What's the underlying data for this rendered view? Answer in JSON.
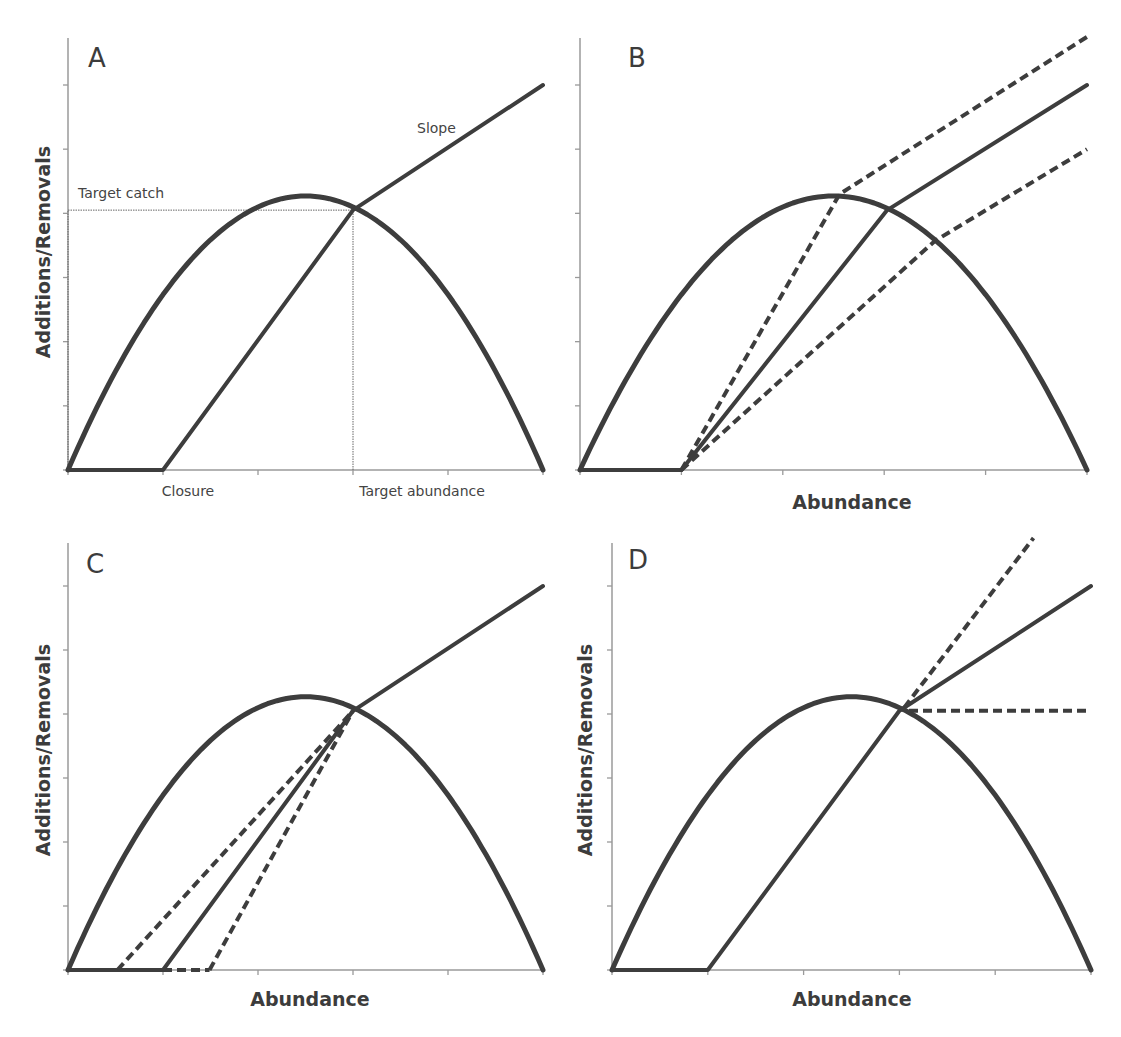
{
  "chart_data": [
    {
      "panel": "A",
      "type": "line",
      "title": "A",
      "xlabel": "",
      "ylabel": "Additions/Removals",
      "xlim": [
        0,
        5
      ],
      "ylim": [
        0,
        6.75
      ],
      "x_ticks": [
        0,
        1,
        2,
        3,
        4,
        5
      ],
      "x_tick_labels": {
        "1": "Closure",
        "3": "Target abundance"
      },
      "y_ticks": [
        0,
        1,
        2,
        3,
        4,
        5,
        6
      ],
      "grid": false,
      "annotations": [
        {
          "text": "Target catch",
          "x": 0.1,
          "y": 4.3
        },
        {
          "text": "Slope",
          "x": 3.65,
          "y": 5.1
        }
      ],
      "reference_lines": [
        {
          "name": "target-catch-line",
          "style": "dotted",
          "points": [
            [
              0,
              4.05
            ],
            [
              3,
              4.05
            ]
          ]
        },
        {
          "name": "target-abundance-line",
          "style": "dotted",
          "points": [
            [
              3,
              0
            ],
            [
              3,
              4.05
            ]
          ]
        },
        {
          "name": "y-axis-dotted",
          "style": "dotted",
          "points": [
            [
              0,
              0
            ],
            [
              0,
              4.05
            ]
          ]
        }
      ],
      "series": [
        {
          "name": "Production (additions)",
          "style": "solid-thick",
          "kind": "parabola",
          "zeros": [
            0,
            5
          ],
          "peak": [
            2.5,
            4.27
          ]
        },
        {
          "name": "Harvest control rule",
          "style": "solid",
          "points": [
            [
              0,
              0
            ],
            [
              1,
              0
            ],
            [
              3,
              4.05
            ],
            [
              5,
              6
            ]
          ]
        }
      ]
    },
    {
      "panel": "B",
      "type": "line",
      "title": "B",
      "xlabel": "Abundance",
      "ylabel": "",
      "xlim": [
        0,
        5
      ],
      "ylim": [
        0,
        6.75
      ],
      "x_ticks": [
        0,
        1,
        2,
        3,
        4,
        5
      ],
      "y_ticks": [
        0,
        1,
        2,
        3,
        4,
        5,
        6
      ],
      "grid": false,
      "series": [
        {
          "name": "Production (additions)",
          "style": "solid-thick",
          "kind": "parabola",
          "zeros": [
            0,
            5
          ],
          "peak": [
            2.5,
            4.27
          ]
        },
        {
          "name": "Closure segment",
          "style": "solid",
          "points": [
            [
              0,
              0
            ],
            [
              1,
              0
            ]
          ]
        },
        {
          "name": "HCR higher target catch",
          "style": "dashed",
          "points": [
            [
              1,
              0
            ],
            [
              2.56,
              4.3
            ],
            [
              5,
              6.75
            ]
          ]
        },
        {
          "name": "HCR base",
          "style": "solid",
          "points": [
            [
              1,
              0
            ],
            [
              3.03,
              4.05
            ],
            [
              5,
              6
            ]
          ]
        },
        {
          "name": "HCR lower target catch",
          "style": "dashed",
          "points": [
            [
              1,
              0
            ],
            [
              3.5,
              3.57
            ],
            [
              5,
              5
            ]
          ]
        }
      ]
    },
    {
      "panel": "C",
      "type": "line",
      "title": "C",
      "xlabel": "Abundance",
      "ylabel": "Additions/Removals",
      "xlim": [
        0,
        5
      ],
      "ylim": [
        0,
        6.75
      ],
      "x_ticks": [
        0,
        1,
        2,
        3,
        4,
        5
      ],
      "y_ticks": [
        0,
        1,
        2,
        3,
        4,
        5,
        6
      ],
      "grid": false,
      "series": [
        {
          "name": "Production (additions)",
          "style": "solid-thick",
          "kind": "parabola",
          "zeros": [
            0,
            5
          ],
          "peak": [
            2.5,
            4.27
          ]
        },
        {
          "name": "Closure segment",
          "style": "solid",
          "points": [
            [
              0,
              0
            ],
            [
              1,
              0
            ]
          ]
        },
        {
          "name": "Closure segment extension",
          "style": "dashed",
          "points": [
            [
              1,
              0
            ],
            [
              1.49,
              0
            ]
          ]
        },
        {
          "name": "HCR lower closure",
          "style": "dashed",
          "points": [
            [
              0.52,
              0
            ],
            [
              3,
              4.05
            ]
          ]
        },
        {
          "name": "HCR base",
          "style": "solid",
          "points": [
            [
              1,
              0
            ],
            [
              3,
              4.05
            ],
            [
              5,
              6
            ]
          ]
        },
        {
          "name": "HCR higher closure",
          "style": "dashed",
          "points": [
            [
              1.49,
              0
            ],
            [
              3,
              4.05
            ]
          ]
        }
      ]
    },
    {
      "panel": "D",
      "type": "line",
      "title": "D",
      "xlabel": "Abundance",
      "ylabel": "Additions/Removals",
      "xlim": [
        0,
        5
      ],
      "ylim": [
        0,
        6.75
      ],
      "x_ticks": [
        0,
        1,
        2,
        3,
        4,
        5
      ],
      "y_ticks": [
        0,
        1,
        2,
        3,
        4,
        5,
        6
      ],
      "grid": false,
      "series": [
        {
          "name": "Production (additions)",
          "style": "solid-thick",
          "kind": "parabola",
          "zeros": [
            0,
            5
          ],
          "peak": [
            2.5,
            4.27
          ]
        },
        {
          "name": "HCR base",
          "style": "solid",
          "points": [
            [
              0,
              0
            ],
            [
              1,
              0
            ],
            [
              3,
              4.05
            ],
            [
              5,
              6
            ]
          ]
        },
        {
          "name": "HCR steeper slope",
          "style": "dashed",
          "points": [
            [
              3.05,
              4.1
            ],
            [
              4.4,
              6.75
            ]
          ]
        },
        {
          "name": "HCR flat (cap)",
          "style": "dashed",
          "points": [
            [
              3.1,
              4.05
            ],
            [
              5,
              4.05
            ]
          ]
        }
      ]
    }
  ],
  "colors": {
    "line": "#3d3d3d",
    "axis": "#9a9a9a",
    "text": "#3c3c3c"
  }
}
